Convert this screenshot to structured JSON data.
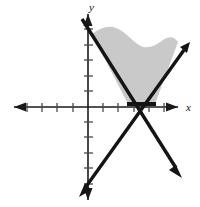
{
  "figure": {
    "width": 200,
    "height": 207,
    "background_color": "#ffffff"
  },
  "axes": {
    "x_axis": {
      "label": "x",
      "label_x": 188,
      "label_y": 108,
      "y_position": 107,
      "x_start": 14,
      "x_end": 178,
      "arrow_left": true,
      "arrow_right": true,
      "tick_spacing": 15.2,
      "tick_length": 9,
      "ticks": [
        27,
        42,
        57,
        73,
        88,
        103,
        118,
        134,
        149,
        164
      ],
      "color": "#1a1a1a"
    },
    "y_axis": {
      "label": "y",
      "label_x": 92,
      "label_y": 9,
      "x_position": 88,
      "y_start": 14,
      "y_end": 200,
      "arrow_up": true,
      "arrow_down": true,
      "tick_spacing": 15.5,
      "tick_length": 9,
      "ticks": [
        29,
        45,
        60,
        76,
        91,
        122,
        137,
        153,
        168,
        184
      ],
      "color": "#1a1a1a"
    },
    "origin": {
      "x": 88,
      "y": 107
    }
  },
  "lines": [
    {
      "name": "descending-line",
      "description": "line with negative slope from upper left to lower right",
      "start": {
        "x": 82,
        "y": 19
      },
      "end": {
        "x": 181,
        "y": 176
      },
      "arrow_start": false,
      "arrow_end": true,
      "stroke_width": 3.4,
      "color": "#141414"
    },
    {
      "name": "ascending-line",
      "description": "line with positive slope from lower left to upper right",
      "start": {
        "x": 80,
        "y": 196
      },
      "end": {
        "x": 189,
        "y": 44
      },
      "arrow_start": true,
      "arrow_end": true,
      "stroke_width": 3.4,
      "color": "#141414"
    }
  ],
  "intersection": {
    "x": 141,
    "y": 112
  },
  "shaded_region": {
    "name": "solution-region",
    "fill_color": "#c9c9c9",
    "description": "gray shaded V-shaped region between the two lines above the x-axis with a wavy upper edge",
    "path": "M 128 104 L 92 34 C 100 28 108 25 116 28 C 125 31 131 40 139 45 C 147 50 155 46 163 40 C 169 36 174 36 178 42 L 155 104 Z"
  },
  "highlight_segment": {
    "name": "x-axis-boundary-segment",
    "x1": 127,
    "x2": 156,
    "y": 104,
    "stroke_width": 4,
    "color": "#141414"
  }
}
